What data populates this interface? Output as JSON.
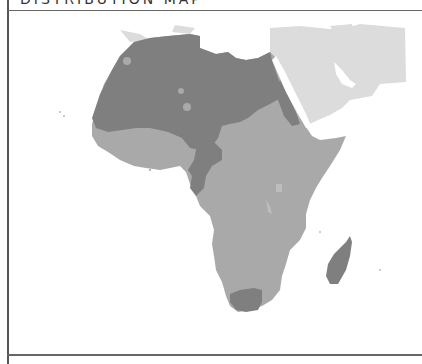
{
  "header": {
    "title": "DISTRIBUTION MAP"
  },
  "map": {
    "region": "Africa",
    "legend_colors": {
      "zone_dark": "#7f7f7f",
      "zone_medium": "#a9a9a9",
      "zone_light": "#dcdcdc",
      "background": "#ffffff"
    }
  }
}
